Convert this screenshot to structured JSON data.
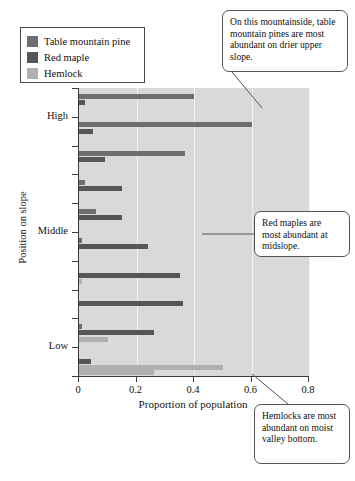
{
  "legend": {
    "items": [
      {
        "label": "Table mountain pine",
        "color": "#6e6e6e",
        "key": "pine"
      },
      {
        "label": "Red maple",
        "color": "#565656",
        "key": "maple"
      },
      {
        "label": "Hemlock",
        "color": "#b0b0b0",
        "key": "hemlock"
      }
    ]
  },
  "callouts": [
    {
      "name": "callout-pine",
      "text": "On this mountainside, table mountain pines are most abundant on drier upper slope.",
      "x": 222,
      "y": 10,
      "w": 126,
      "h": 62
    },
    {
      "name": "callout-maple",
      "text": "Red maples are most abundant at midslope.",
      "x": 254,
      "y": 211,
      "w": 96,
      "h": 46
    },
    {
      "name": "callout-hemlock",
      "text": "Hemlocks are most abundant on moist valley bottom.",
      "x": 254,
      "y": 404,
      "w": 96,
      "h": 60
    }
  ],
  "chart_data": {
    "type": "bar",
    "orientation": "horizontal",
    "title": "",
    "xlabel": "Proportion of population",
    "ylabel": "Position on slope",
    "xlim": [
      0,
      0.8
    ],
    "xticks": [
      0,
      0.2,
      0.4,
      0.6,
      0.8
    ],
    "xticklabels": [
      "0",
      "0.2",
      "0.4",
      "0.6",
      "0.8"
    ],
    "yticklabels": [
      "High",
      "Middle",
      "Low"
    ],
    "ytick_positions": [
      1,
      5,
      9
    ],
    "grid": "vertical",
    "legend_position": "top-left-outside",
    "categories": [
      "Position 1 (highest)",
      "Position 2",
      "Position 3",
      "Position 4",
      "Position 5",
      "Position 6 (middle)",
      "Position 7",
      "Position 8",
      "Position 9",
      "Position 10 (lowest)"
    ],
    "series": [
      {
        "name": "Table mountain pine",
        "color": "#6e6e6e",
        "values": [
          0.4,
          0.6,
          0.37,
          0.02,
          0.06,
          0.01,
          0.0,
          0.0,
          0.01,
          0.0
        ]
      },
      {
        "name": "Red maple",
        "color": "#565656",
        "values": [
          0.02,
          0.05,
          0.09,
          0.15,
          0.15,
          0.24,
          0.35,
          0.36,
          0.26,
          0.04
        ]
      },
      {
        "name": "Hemlock",
        "color": "#b0b0b0",
        "values": [
          0.0,
          0.0,
          0.0,
          0.0,
          0.0,
          0.0,
          0.01,
          0.0,
          0.1,
          0.5
        ]
      }
    ],
    "extra_hemlock_tail": {
      "note": "lowest position hemlock second band",
      "value": 0.26
    }
  }
}
